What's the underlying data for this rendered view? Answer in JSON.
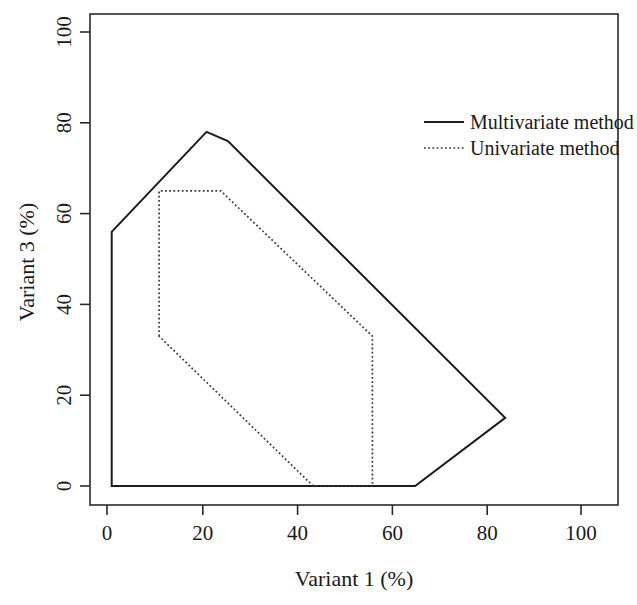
{
  "chart_data": {
    "type": "line",
    "title": "",
    "xlabel": "Variant 1 (%)",
    "ylabel": "Variant 3 (%)",
    "xlim": [
      -2.5,
      107
    ],
    "ylim": [
      -3,
      107
    ],
    "xticks": [
      0,
      20,
      40,
      60,
      80,
      100
    ],
    "yticks": [
      0,
      20,
      40,
      60,
      80,
      100
    ],
    "xtick_labels": [
      "0",
      "20",
      "40",
      "60",
      "80",
      "100"
    ],
    "ytick_labels": [
      "0",
      "20",
      "40",
      "60",
      "80",
      "100"
    ],
    "grid": false,
    "legend_position": "top-right",
    "series": [
      {
        "name": "Multivariate method",
        "style": "solid",
        "color": "#1c1c1c",
        "closed": true,
        "points": [
          [
            1.0,
            0.0
          ],
          [
            1.0,
            56.0
          ],
          [
            21.0,
            78.0
          ],
          [
            25.5,
            76.0
          ],
          [
            84.0,
            15.0
          ],
          [
            65.0,
            0.0
          ]
        ]
      },
      {
        "name": "Univariate method",
        "style": "dotted",
        "color": "#3a3a3a",
        "closed": true,
        "points": [
          [
            11.0,
            33.0
          ],
          [
            11.0,
            65.0
          ],
          [
            24.0,
            65.0
          ],
          [
            56.0,
            33.0
          ],
          [
            56.0,
            0.0
          ],
          [
            43.5,
            0.0
          ]
        ]
      }
    ]
  },
  "axes": {
    "x_title": "Variant 1 (%)",
    "y_title": "Variant 3 (%)",
    "x_ticks": [
      {
        "value": 0,
        "label": "0"
      },
      {
        "value": 20,
        "label": "20"
      },
      {
        "value": 40,
        "label": "40"
      },
      {
        "value": 60,
        "label": "60"
      },
      {
        "value": 80,
        "label": "80"
      },
      {
        "value": 100,
        "label": "100"
      }
    ],
    "y_ticks": [
      {
        "value": 0,
        "label": "0"
      },
      {
        "value": 20,
        "label": "20"
      },
      {
        "value": 40,
        "label": "40"
      },
      {
        "value": 60,
        "label": "60"
      },
      {
        "value": 80,
        "label": "80"
      },
      {
        "value": 100,
        "label": "100"
      }
    ]
  },
  "legend": {
    "entries": [
      {
        "label": "Multivariate method",
        "style": "solid"
      },
      {
        "label": "Univariate method",
        "style": "dotted"
      }
    ]
  },
  "colors": {
    "background": "#ffffff",
    "axis": "#2a2a2a",
    "multivariate": "#1c1c1c",
    "univariate": "#3a3a3a"
  }
}
